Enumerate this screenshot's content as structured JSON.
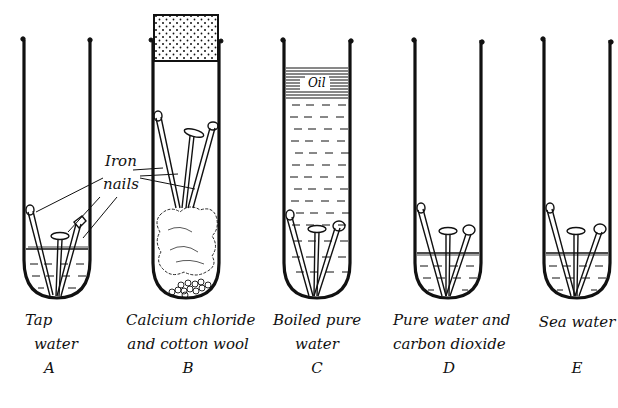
{
  "diagram": {
    "annotation": {
      "line1": "Iron",
      "line2": "nails"
    },
    "oil_label": "Oil",
    "tubes": [
      {
        "id": "A",
        "label_line1": "Tap",
        "label_line2": "water",
        "letter": "A",
        "contents": "tap water"
      },
      {
        "id": "B",
        "label_line1": "Calcium chloride",
        "label_line2": "and cotton wool",
        "letter": "B",
        "contents": "calcium chloride and cotton wool, stoppered"
      },
      {
        "id": "C",
        "label_line1": "Boiled pure",
        "label_line2": "water",
        "letter": "C",
        "contents": "boiled pure water with oil layer"
      },
      {
        "id": "D",
        "label_line1": "Pure water and",
        "label_line2": "carbon dioxide",
        "letter": "D",
        "contents": "pure water and carbon dioxide"
      },
      {
        "id": "E",
        "label_line1": "Sea water",
        "label_line2": "",
        "letter": "E",
        "contents": "sea water"
      }
    ],
    "colors": {
      "ink": "#111111",
      "background": "#ffffff"
    }
  }
}
